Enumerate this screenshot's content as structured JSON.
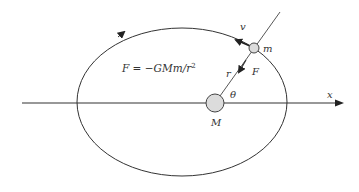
{
  "diagram": {
    "labels": {
      "force_law": "F = −GMm/r²",
      "force_law_main": "F = −GMm/r",
      "force_law_exp": "2",
      "velocity": "v",
      "small_mass": "m",
      "force": "F",
      "radius": "r",
      "angle": "θ",
      "large_mass": "M",
      "x_axis": "x"
    },
    "colors": {
      "stroke": "#333333",
      "mass_fill": "#dcdcdc",
      "background": "#ffffff"
    },
    "geometry": {
      "ellipse": {
        "cx": 182,
        "cy": 102,
        "rx": 105,
        "ry": 74
      },
      "x_axis": {
        "x1": 22,
        "y1": 103,
        "x2": 343,
        "y2": 103
      },
      "large_mass": {
        "cx": 215,
        "cy": 103,
        "r": 9
      },
      "small_mass": {
        "cx": 254,
        "cy": 48,
        "r": 5
      }
    }
  }
}
